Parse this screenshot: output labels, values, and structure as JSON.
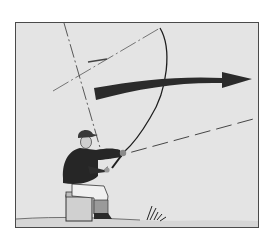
{
  "diagram": {
    "elements": [
      "frame",
      "title-label",
      "rod-arc",
      "cast-direction-arrow",
      "angle-guide-lines",
      "angler",
      "seat-box",
      "ground",
      "grass-tuft"
    ],
    "colors": {
      "background": "#e4e4e4",
      "frame_border": "#4a4a4a",
      "arrow": "#2b2b2b",
      "ink": "#1e1e1e"
    }
  }
}
